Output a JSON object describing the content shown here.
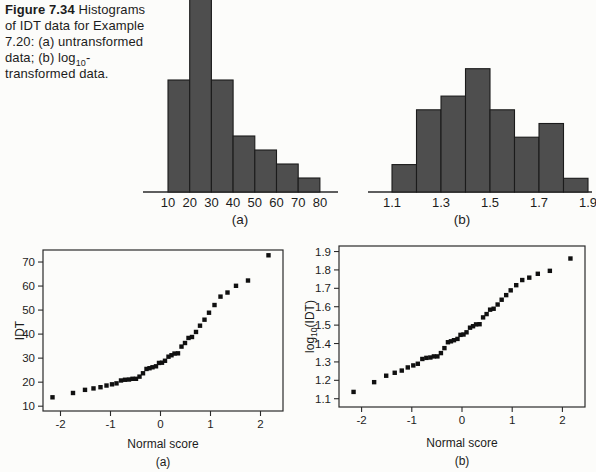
{
  "caption": {
    "title": "Figure 7.34",
    "body_before_sub": " Histograms of IDT data for Example 7.20: (a) untransformed data; (b) log",
    "sub": "10",
    "body_after_sub": "-transformed data."
  },
  "colors": {
    "bar_fill": "#4e4e4e",
    "bar_stroke": "#1b1b1b",
    "marker": "#101010",
    "axis": "#2a2a2a",
    "text": "#1c1c1c",
    "background": "#fcfcfa"
  },
  "chart_data": [
    {
      "id": "hist_a",
      "type": "histogram",
      "title": "Histogram of untransformed IDT data",
      "sublabel": "(a)",
      "bin_edges": [
        10,
        20,
        30,
        40,
        50,
        60,
        70,
        80
      ],
      "counts": [
        8,
        14,
        8,
        4,
        3,
        2,
        1
      ],
      "tick_values": [
        10,
        20,
        30,
        40,
        50,
        60,
        70,
        80
      ],
      "tick_labels": [
        "10",
        "20",
        "30",
        "40",
        "50",
        "60",
        "70",
        "80"
      ]
    },
    {
      "id": "hist_b",
      "type": "histogram",
      "title": "Histogram of log10-transformed IDT data",
      "sublabel": "(b)",
      "bin_edges": [
        1.1,
        1.2,
        1.3,
        1.4,
        1.5,
        1.6,
        1.7,
        1.8,
        1.9
      ],
      "counts": [
        2,
        6,
        7,
        9,
        6,
        4,
        5,
        1
      ],
      "tick_values": [
        1.1,
        1.3,
        1.5,
        1.7,
        1.9
      ],
      "tick_labels": [
        "1.1",
        "1.3",
        "1.5",
        "1.7",
        "1.9"
      ]
    },
    {
      "id": "qq_a",
      "type": "scatter",
      "title": "Normal probability plot of IDT",
      "sublabel": "(a)",
      "xlabel": "Normal score",
      "ylabel_parts": [
        {
          "t": "IDT"
        }
      ],
      "xlim": [
        -2.35,
        2.45
      ],
      "ylim": [
        8,
        75
      ],
      "xticks": [
        -2,
        -1,
        0,
        1,
        2
      ],
      "xtick_labels": [
        "-2",
        "-1",
        "0",
        "1",
        "2"
      ],
      "yticks": [
        10,
        20,
        30,
        40,
        50,
        60,
        70
      ],
      "ytick_labels": [
        "10",
        "20",
        "30",
        "40",
        "50",
        "60",
        "70"
      ],
      "x": [
        -2.16,
        -1.75,
        -1.51,
        -1.34,
        -1.2,
        -1.08,
        -0.97,
        -0.88,
        -0.79,
        -0.71,
        -0.63,
        -0.56,
        -0.49,
        -0.42,
        -0.35,
        -0.28,
        -0.22,
        -0.16,
        -0.09,
        -0.03,
        0.03,
        0.09,
        0.16,
        0.22,
        0.28,
        0.35,
        0.42,
        0.49,
        0.56,
        0.63,
        0.71,
        0.79,
        0.88,
        0.97,
        1.08,
        1.2,
        1.34,
        1.51,
        1.75,
        2.16
      ],
      "y": [
        13.7,
        15.5,
        16.8,
        17.4,
        17.9,
        18.6,
        19.1,
        19.5,
        20.7,
        21.0,
        21.1,
        21.4,
        21.4,
        22.3,
        23.7,
        25.5,
        25.8,
        26.2,
        26.6,
        28.0,
        28.1,
        28.9,
        30.6,
        31.2,
        31.9,
        32.0,
        34.8,
        36.3,
        38.4,
        38.8,
        40.9,
        43.5,
        46.0,
        48.9,
        52.1,
        55.6,
        57.3,
        60.1,
        62.3,
        72.8
      ]
    },
    {
      "id": "qq_b",
      "type": "scatter",
      "title": "Normal probability plot of log10(IDT)",
      "sublabel": "(b)",
      "xlabel": "Normal score",
      "ylabel_parts": [
        {
          "t": "log"
        },
        {
          "t": "10",
          "sub": true
        },
        {
          "t": "(IDT)"
        }
      ],
      "xlim": [
        -2.45,
        2.45
      ],
      "ylim": [
        1.055,
        1.93
      ],
      "xticks": [
        -2,
        -1,
        0,
        1,
        2
      ],
      "xtick_labels": [
        "-2",
        "-1",
        "0",
        "1",
        "2"
      ],
      "yticks": [
        1.1,
        1.2,
        1.3,
        1.4,
        1.5,
        1.6,
        1.7,
        1.8,
        1.9
      ],
      "ytick_labels": [
        "1.1",
        "1.2",
        "1.3",
        "1.4",
        "1.5",
        "1.6",
        "1.7",
        "1.8",
        "1.9"
      ],
      "x": [
        -2.16,
        -1.75,
        -1.51,
        -1.34,
        -1.2,
        -1.08,
        -0.97,
        -0.88,
        -0.79,
        -0.71,
        -0.63,
        -0.56,
        -0.49,
        -0.42,
        -0.35,
        -0.28,
        -0.22,
        -0.16,
        -0.09,
        -0.03,
        0.03,
        0.09,
        0.16,
        0.22,
        0.28,
        0.35,
        0.42,
        0.49,
        0.56,
        0.63,
        0.71,
        0.79,
        0.88,
        0.97,
        1.08,
        1.2,
        1.34,
        1.51,
        1.75,
        2.16
      ],
      "y": [
        1.137,
        1.19,
        1.225,
        1.241,
        1.253,
        1.27,
        1.281,
        1.29,
        1.316,
        1.322,
        1.324,
        1.33,
        1.33,
        1.348,
        1.375,
        1.407,
        1.412,
        1.418,
        1.425,
        1.447,
        1.449,
        1.461,
        1.486,
        1.494,
        1.504,
        1.505,
        1.542,
        1.56,
        1.584,
        1.589,
        1.612,
        1.638,
        1.663,
        1.689,
        1.717,
        1.745,
        1.758,
        1.779,
        1.795,
        1.862
      ]
    }
  ]
}
